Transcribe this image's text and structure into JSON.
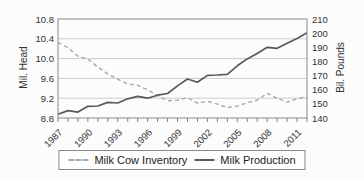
{
  "chart_data": {
    "type": "line",
    "x": [
      1987,
      1988,
      1989,
      1990,
      1991,
      1992,
      1993,
      1994,
      1995,
      1996,
      1997,
      1998,
      1999,
      2000,
      2001,
      2002,
      2003,
      2004,
      2005,
      2006,
      2007,
      2008,
      2009,
      2010,
      2011,
      2012
    ],
    "x_labeled_years": [
      1987,
      1990,
      1993,
      1996,
      1999,
      2002,
      2005,
      2008,
      2011
    ],
    "series": [
      {
        "name": "Milk Cow Inventory",
        "axis": "left",
        "style": "dashed",
        "color": "#a8a8a8",
        "values": [
          10.33,
          10.22,
          10.05,
          9.99,
          9.83,
          9.69,
          9.58,
          9.49,
          9.46,
          9.37,
          9.25,
          9.15,
          9.16,
          9.21,
          9.1,
          9.14,
          9.08,
          9.01,
          9.04,
          9.11,
          9.16,
          9.3,
          9.2,
          9.12,
          9.19,
          9.23
        ]
      },
      {
        "name": "Milk Production",
        "axis": "right",
        "style": "solid",
        "color": "#595959",
        "values": [
          142.7,
          145.2,
          144.2,
          148.3,
          148.5,
          151.0,
          150.6,
          153.6,
          155.3,
          154.0,
          156.1,
          157.3,
          162.7,
          167.6,
          165.3,
          170.1,
          170.4,
          170.9,
          176.9,
          181.8,
          185.7,
          190.0,
          189.3,
          192.8,
          196.2,
          200.3
        ]
      }
    ],
    "axis_left": {
      "label": "Mil. Head",
      "min": 8.8,
      "max": 10.8,
      "ticks": [
        8.8,
        9.2,
        9.6,
        10.0,
        10.4,
        10.8
      ]
    },
    "axis_right": {
      "label": "Bil. Pounds",
      "min": 140,
      "max": 210,
      "ticks": [
        140,
        150,
        160,
        170,
        180,
        190,
        200,
        210
      ]
    },
    "grid": "horizontal",
    "legend_position": "bottom",
    "colors": {
      "grid": "#cccccc",
      "border": "#8a8a8a",
      "tick": "#777777",
      "text": "#333333",
      "background": "#fcfcfc"
    }
  }
}
